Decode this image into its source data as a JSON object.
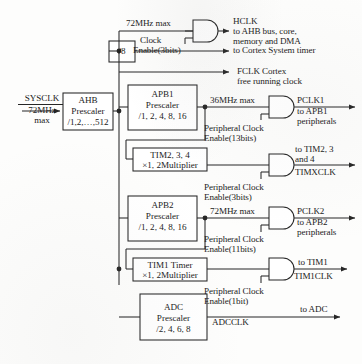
{
  "diagram": {
    "type": "block-diagram",
    "line_color": "#262626",
    "fill_color": "#ffffff"
  },
  "input": {
    "name": "SYSCLK",
    "rate": "72MHz",
    "rate_qualifier": "max"
  },
  "blocks": {
    "ahb_prescaler": {
      "line1": "AHB",
      "line2": "Prescaler",
      "line3": "/1,2,…,512"
    },
    "div8": {
      "label": "/8"
    },
    "apb1_prescaler": {
      "line1": "APB1",
      "line2": "Prescaler",
      "line3": "/1, 2, 4, 8, 16"
    },
    "tim234": {
      "line1": "TIM2, 3, 4",
      "line2": "×1, 2Multiplier"
    },
    "apb2_prescaler": {
      "line1": "APB2",
      "line2": "Prescaler",
      "line3": "/1, 2, 4, 8, 16"
    },
    "tim1": {
      "line1": "TIM1 Timer",
      "line2": "×1, 2Multiplier"
    },
    "adc_prescaler": {
      "line1": "ADC",
      "line2": "Prescaler",
      "line3": "/2, 4, 6, 8"
    }
  },
  "rates": {
    "hclk_max": "72MHz max",
    "pclk1_max": "36MHz max",
    "pclk2_max": "72MHz max"
  },
  "enables": {
    "hclk": {
      "line1": "Clock",
      "line2": "Enable(3bits)"
    },
    "pclk1": {
      "line1": "Peripheral Clock",
      "line2": "Enable(13bits)"
    },
    "timx": {
      "line1": "Peripheral Clock",
      "line2": "Enable(3bits)"
    },
    "pclk2": {
      "line1": "Peripheral Clock",
      "line2": "Enable(11bits)"
    },
    "tim1": {
      "line1": "Peripheral Clock",
      "line2": "Enable(1bit)"
    }
  },
  "outputs": {
    "hclk": {
      "line1": "HCLK",
      "line2": "to AHB bus, core,",
      "line3": "memory and DMA"
    },
    "systick": {
      "line1": "to Cortex System timer"
    },
    "fclk": {
      "line1": "FCLK Cortex",
      "line2": "free running clock"
    },
    "pclk1": {
      "line1": "PCLK1",
      "line2": "to APB1",
      "line3": "peripherals"
    },
    "timxclk": {
      "line1": "to TIM2, 3",
      "line2": "and 4",
      "line3": "TIMXCLK"
    },
    "pclk2": {
      "line1": "PCLK2",
      "line2": "to APB2",
      "line3": "peripherals"
    },
    "tim1clk": {
      "line1": "to TIM1",
      "line2": "TIM1CLK"
    },
    "adcclk": {
      "line1": "to ADC",
      "line2": "ADCCLK"
    }
  }
}
